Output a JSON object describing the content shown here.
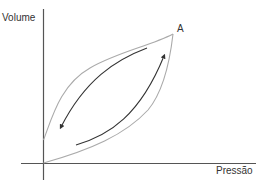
{
  "axes": {
    "y_label": "Volume",
    "x_label": "Pressão"
  },
  "point_label": "A",
  "colors": {
    "axis": "#555555",
    "loop": "#aaaaaa",
    "arrow": "#333333",
    "text": "#333333"
  },
  "arrows": [
    {
      "name": "upper-arrow",
      "direction": "toward lower-left"
    },
    {
      "name": "lower-arrow",
      "direction": "toward upper-right"
    }
  ]
}
